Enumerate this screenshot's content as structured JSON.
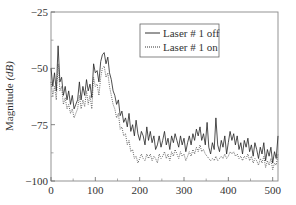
{
  "chart_data": {
    "type": "line",
    "title": "",
    "xlabel": "",
    "ylabel": "Magnitude (dB)",
    "ylabel_parts": {
      "main": "Magnitude ",
      "italic": "(dB)"
    },
    "xlim": [
      0,
      512
    ],
    "ylim": [
      -100,
      -25
    ],
    "x_ticks": [
      0,
      100,
      200,
      300,
      400,
      500
    ],
    "x_minor_ticks": [
      50,
      150,
      250,
      350,
      450
    ],
    "y_ticks": [
      -25,
      -50,
      -75,
      -100
    ],
    "y_minor_ticks": [
      -37.5,
      -62.5,
      -87.5
    ],
    "grid": false,
    "legend": {
      "position": "top-right",
      "entries": [
        "Laser # 1 off",
        "Laser # 1 on"
      ]
    },
    "x": [
      0,
      4,
      8,
      12,
      16,
      20,
      24,
      28,
      32,
      36,
      40,
      44,
      48,
      52,
      56,
      60,
      64,
      68,
      72,
      76,
      80,
      84,
      88,
      92,
      96,
      100,
      104,
      108,
      112,
      116,
      120,
      124,
      128,
      132,
      136,
      140,
      144,
      148,
      152,
      156,
      160,
      164,
      168,
      172,
      176,
      180,
      184,
      188,
      192,
      196,
      200,
      204,
      208,
      212,
      216,
      220,
      224,
      228,
      232,
      236,
      240,
      244,
      248,
      252,
      256,
      260,
      264,
      268,
      272,
      276,
      280,
      284,
      288,
      292,
      296,
      300,
      304,
      308,
      312,
      316,
      320,
      324,
      328,
      332,
      336,
      340,
      344,
      348,
      352,
      356,
      360,
      364,
      368,
      372,
      376,
      380,
      384,
      388,
      392,
      396,
      400,
      404,
      408,
      412,
      416,
      420,
      424,
      428,
      432,
      436,
      440,
      444,
      448,
      452,
      456,
      460,
      464,
      468,
      472,
      476,
      480,
      484,
      488,
      492,
      496,
      500,
      504,
      508,
      512
    ],
    "series": [
      {
        "name": "Laser # 1 off",
        "style": "solid",
        "values": [
          -50,
          -58,
          -52,
          -60,
          -40,
          -56,
          -54,
          -62,
          -58,
          -64,
          -60,
          -66,
          -62,
          -68,
          -66,
          -64,
          -56,
          -64,
          -58,
          -62,
          -55,
          -60,
          -57,
          -63,
          -48,
          -52,
          -51,
          -56,
          -47,
          -44,
          -43,
          -48,
          -45,
          -52,
          -55,
          -60,
          -62,
          -66,
          -64,
          -71,
          -69,
          -74,
          -72,
          -76,
          -70,
          -78,
          -75,
          -80,
          -73,
          -79,
          -82,
          -78,
          -80,
          -84,
          -76,
          -82,
          -78,
          -83,
          -80,
          -86,
          -84,
          -80,
          -85,
          -82,
          -78,
          -84,
          -81,
          -86,
          -80,
          -83,
          -79,
          -82,
          -85,
          -80,
          -84,
          -81,
          -87,
          -83,
          -80,
          -84,
          -79,
          -82,
          -77,
          -80,
          -76,
          -82,
          -79,
          -84,
          -74,
          -85,
          -88,
          -83,
          -86,
          -72,
          -84,
          -87,
          -82,
          -85,
          -80,
          -88,
          -83,
          -78,
          -82,
          -79,
          -84,
          -80,
          -86,
          -83,
          -88,
          -82,
          -85,
          -81,
          -87,
          -84,
          -89,
          -83,
          -86,
          -90,
          -85,
          -88,
          -83,
          -91,
          -86,
          -89,
          -85,
          -92,
          -87,
          -90,
          -80
        ]
      },
      {
        "name": "Laser # 1 on",
        "style": "dotted",
        "values": [
          -56,
          -62,
          -58,
          -64,
          -48,
          -60,
          -58,
          -66,
          -63,
          -68,
          -66,
          -70,
          -68,
          -72,
          -70,
          -68,
          -62,
          -68,
          -64,
          -67,
          -60,
          -66,
          -62,
          -68,
          -54,
          -58,
          -57,
          -62,
          -54,
          -50,
          -49,
          -54,
          -52,
          -58,
          -62,
          -66,
          -68,
          -72,
          -70,
          -77,
          -76,
          -80,
          -79,
          -84,
          -82,
          -87,
          -86,
          -90,
          -89,
          -92,
          -90,
          -88,
          -90,
          -91,
          -88,
          -90,
          -88,
          -91,
          -89,
          -90,
          -92,
          -88,
          -90,
          -89,
          -87,
          -90,
          -88,
          -91,
          -87,
          -89,
          -86,
          -88,
          -90,
          -87,
          -89,
          -88,
          -91,
          -89,
          -87,
          -89,
          -86,
          -88,
          -85,
          -87,
          -84,
          -87,
          -86,
          -88,
          -89,
          -90,
          -91,
          -90,
          -91,
          -89,
          -91,
          -90,
          -89,
          -90,
          -88,
          -90,
          -89,
          -87,
          -88,
          -87,
          -89,
          -88,
          -90,
          -89,
          -91,
          -89,
          -90,
          -88,
          -91,
          -89,
          -92,
          -90,
          -91,
          -93,
          -90,
          -92,
          -89,
          -94,
          -91,
          -93,
          -90,
          -95,
          -92,
          -93,
          -88
        ]
      }
    ]
  }
}
